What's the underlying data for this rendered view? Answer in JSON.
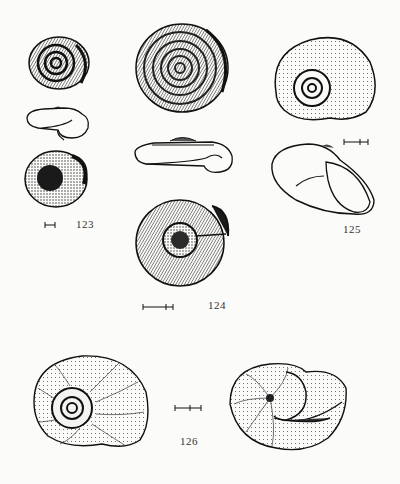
{
  "plate": {
    "figures": [
      {
        "number": "123",
        "views": [
          "apical-view",
          "side-view",
          "umbilical-view"
        ],
        "scale_bar": "short"
      },
      {
        "number": "124",
        "views": [
          "apical-view",
          "side-view",
          "umbilical-view"
        ],
        "scale_bar": "medium"
      },
      {
        "number": "125",
        "views": [
          "apical-view",
          "apertural-view"
        ],
        "scale_bar": "medium"
      },
      {
        "number": "126",
        "views": [
          "apical-view",
          "apertural-view"
        ],
        "scale_bar": "medium"
      }
    ]
  },
  "labels": {
    "fig123": "123",
    "fig124": "124",
    "fig125": "125",
    "fig126": "126"
  },
  "colors": {
    "ink": "#1e1e1e",
    "paper": "#fbfbfa"
  }
}
